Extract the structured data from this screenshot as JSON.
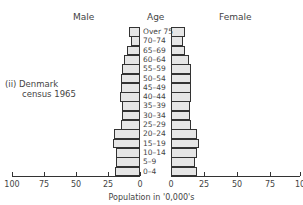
{
  "chart_data": {
    "type": "bar",
    "subtype": "population-pyramid",
    "title": "(ii) Denmark census 1965",
    "headers": {
      "left": "Male",
      "center": "Age",
      "right": "Female"
    },
    "xlabel": "Population in '0,000's",
    "xlim": [
      0,
      100
    ],
    "xticks": [
      100,
      75,
      50,
      25,
      0,
      0,
      25,
      50,
      75,
      100
    ],
    "categories": [
      "Over 75",
      "70–74",
      "65–69",
      "60–64",
      "55–59",
      "50–54",
      "45–49",
      "40–44",
      "35–39",
      "30–34",
      "25–29",
      "20–24",
      "15–19",
      "10–14",
      "5–9",
      "0–4"
    ],
    "series": [
      {
        "name": "Male",
        "values": [
          8.5,
          7,
          10,
          12.5,
          14,
          15,
          15,
          15.5,
          14,
          14,
          15,
          20,
          21,
          19,
          19,
          19.5
        ]
      },
      {
        "name": "Female",
        "values": [
          11,
          9.5,
          11,
          14,
          15.5,
          15.5,
          16,
          16,
          15,
          15,
          16,
          20,
          21.5,
          20,
          19,
          20.5
        ]
      }
    ],
    "grid": false
  },
  "note": {
    "line1": "(ii)  Denmark",
    "line2": "census  1965"
  },
  "headers": {
    "male": "Male",
    "age": "Age",
    "female": "Female"
  },
  "axis": {
    "left_ticks": [
      "100",
      "75",
      "50",
      "25",
      "0"
    ],
    "right_ticks": [
      "0",
      "25",
      "50",
      "75",
      "10"
    ],
    "label": "Population  in  '0,000's"
  }
}
